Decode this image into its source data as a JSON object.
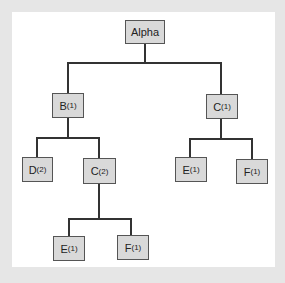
{
  "diagram": {
    "type": "tree",
    "nodes": [
      {
        "id": "alpha",
        "label": "Alpha",
        "sub": ""
      },
      {
        "id": "b1",
        "label": "B",
        "sub": "(1)"
      },
      {
        "id": "c1",
        "label": "C",
        "sub": "(1)"
      },
      {
        "id": "d2",
        "label": "D",
        "sub": "(2)"
      },
      {
        "id": "c2",
        "label": "C",
        "sub": "(2)"
      },
      {
        "id": "e1_right",
        "label": "E",
        "sub": "(1)"
      },
      {
        "id": "f1_right",
        "label": "F",
        "sub": "(1)"
      },
      {
        "id": "e1_bottom",
        "label": "E",
        "sub": "(1)"
      },
      {
        "id": "f1_bottom",
        "label": "F",
        "sub": "(1)"
      }
    ],
    "edges": [
      [
        "alpha",
        "b1"
      ],
      [
        "alpha",
        "c1"
      ],
      [
        "b1",
        "d2"
      ],
      [
        "b1",
        "c2"
      ],
      [
        "c1",
        "e1_right"
      ],
      [
        "c1",
        "f1_right"
      ],
      [
        "c2",
        "e1_bottom"
      ],
      [
        "c2",
        "f1_bottom"
      ]
    ]
  }
}
